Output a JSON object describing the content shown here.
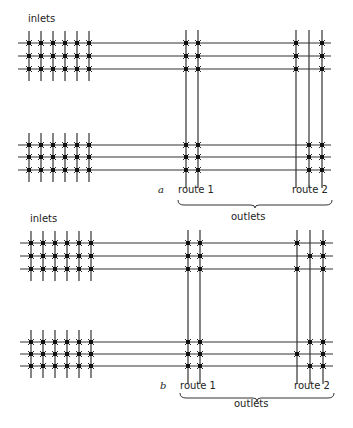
{
  "colors": {
    "line": "#333333",
    "crosspoint": "#111111",
    "text": "#222222",
    "background": "#ffffff"
  },
  "panels": [
    {
      "id": "a",
      "panel_label": "a",
      "inlets_label": "inlets",
      "inlets_label_pos": [
        28,
        22
      ],
      "route1_label": "route 1",
      "route2_label": "route 2",
      "outlets_label": "outlets",
      "panel_label_pos": [
        158,
        193
      ],
      "route1_label_pos": [
        178,
        193
      ],
      "route2_label_pos": [
        292,
        193
      ],
      "outlets_label_pos": [
        231,
        220
      ],
      "brace": {
        "x1": 178,
        "x2": 332,
        "y": 200
      },
      "groups": [
        {
          "rows_y": [
            43,
            56,
            69
          ],
          "inlet_x": [
            29,
            41,
            53,
            65,
            77,
            89
          ],
          "inlet_span": [
            31,
            81
          ],
          "crosspoints": {
            "route1": [
              [
                1,
                1
              ],
              [
                1,
                1
              ],
              [
                1,
                1
              ]
            ],
            "route2": [
              [
                1,
                0,
                1
              ],
              [
                1,
                0,
                1
              ],
              [
                1,
                0,
                1
              ]
            ]
          }
        },
        {
          "rows_y": [
            145,
            157,
            170
          ],
          "inlet_x": [
            29,
            41,
            53,
            65,
            77,
            89
          ],
          "inlet_span": [
            133,
            182
          ],
          "crosspoints": {
            "route1": [
              [
                1,
                1
              ],
              [
                1,
                1
              ],
              [
                1,
                1
              ]
            ],
            "route2": [
              [
                0,
                1,
                1
              ],
              [
                0,
                1,
                1
              ],
              [
                0,
                1,
                1
              ]
            ]
          }
        }
      ],
      "line_x_start": 18,
      "line_x_end": 331,
      "route1_x": [
        186,
        198
      ],
      "route2_x": [
        296,
        309,
        322
      ],
      "route_span": [
        30,
        188
      ]
    },
    {
      "id": "b",
      "panel_label": "b",
      "inlets_label": "inlets",
      "inlets_label_pos": [
        30,
        222
      ],
      "route1_label": "route 1",
      "route2_label": "route 2",
      "outlets_label": "outlets",
      "panel_label_pos": [
        160,
        389
      ],
      "route1_label_pos": [
        180,
        389
      ],
      "route2_label_pos": [
        294,
        389
      ],
      "outlets_label_pos": [
        234,
        407
      ],
      "brace": {
        "x1": 180,
        "x2": 334,
        "y": 393
      },
      "groups": [
        {
          "rows_y": [
            243,
            256,
            269
          ],
          "inlet_x": [
            31,
            43,
            55,
            67,
            79,
            91
          ],
          "inlet_span": [
            231,
            281
          ],
          "crosspoints": {
            "route1": [
              [
                1,
                1
              ],
              [
                1,
                1
              ],
              [
                1,
                1
              ]
            ],
            "route2": [
              [
                1,
                0,
                1
              ],
              [
                0,
                1,
                1
              ],
              [
                1,
                0,
                1
              ]
            ]
          }
        },
        {
          "rows_y": [
            342,
            354,
            366
          ],
          "inlet_x": [
            31,
            43,
            55,
            67,
            79,
            91
          ],
          "inlet_span": [
            330,
            378
          ],
          "crosspoints": {
            "route1": [
              [
                1,
                1
              ],
              [
                1,
                1
              ],
              [
                1,
                1
              ]
            ],
            "route2": [
              [
                0,
                1,
                1
              ],
              [
                1,
                0,
                1
              ],
              [
                0,
                1,
                1
              ]
            ]
          }
        }
      ],
      "line_x_start": 20,
      "line_x_end": 333,
      "route1_x": [
        188,
        200
      ],
      "route2_x": [
        297,
        310,
        323
      ],
      "route_span": [
        230,
        384
      ]
    }
  ],
  "footer_text": ""
}
